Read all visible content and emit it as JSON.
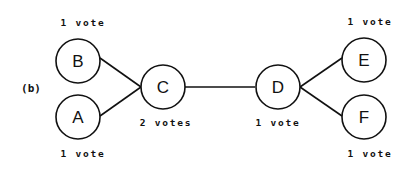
{
  "panel_label": "(b)",
  "nodes": {
    "A": {
      "label": "A",
      "votes": "1 vote"
    },
    "B": {
      "label": "B",
      "votes": "1 vote"
    },
    "C": {
      "label": "C",
      "votes": "2 votes"
    },
    "D": {
      "label": "D",
      "votes": "1 vote"
    },
    "E": {
      "label": "E",
      "votes": "1 vote"
    },
    "F": {
      "label": "F",
      "votes": "1 vote"
    }
  },
  "edges": [
    {
      "from": "B",
      "to": "C"
    },
    {
      "from": "A",
      "to": "C"
    },
    {
      "from": "C",
      "to": "D"
    },
    {
      "from": "D",
      "to": "E"
    },
    {
      "from": "D",
      "to": "F"
    }
  ]
}
